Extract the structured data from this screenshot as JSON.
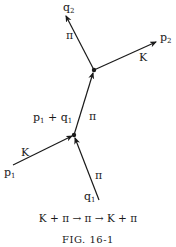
{
  "figure": {
    "caption": "FIG. 16-1",
    "equation": "K + π → π → K + π"
  },
  "vertices": [
    {
      "id": "lower",
      "x": 74,
      "y": 135
    },
    {
      "id": "upper",
      "x": 94,
      "y": 70
    }
  ],
  "lines": [
    {
      "id": "p1",
      "momentum": "p",
      "momentum_sub": "1",
      "particle": "K",
      "from": [
        13,
        165
      ],
      "to": [
        74,
        135
      ]
    },
    {
      "id": "q1",
      "momentum": "q",
      "momentum_sub": "1",
      "particle": "π",
      "from": [
        99,
        200
      ],
      "to": [
        74,
        135
      ]
    },
    {
      "id": "internal",
      "momentum": "p₁ + q₁",
      "particle": "π",
      "from": [
        74,
        135
      ],
      "to": [
        94,
        70
      ]
    },
    {
      "id": "q2",
      "momentum": "q",
      "momentum_sub": "2",
      "particle": "π",
      "from": [
        94,
        70
      ],
      "to": [
        65,
        14
      ]
    },
    {
      "id": "p2",
      "momentum": "p",
      "momentum_sub": "2",
      "particle": "K",
      "from": [
        94,
        70
      ],
      "to": [
        157,
        41
      ]
    }
  ],
  "labels": {
    "q2": {
      "main": "q",
      "sub": "2"
    },
    "p2": {
      "main": "p",
      "sub": "2"
    },
    "p1": {
      "main": "p",
      "sub": "1"
    },
    "q1": {
      "main": "q",
      "sub": "1"
    },
    "internal_a": {
      "main": "p",
      "sub": "1"
    },
    "internal_plus": "+",
    "internal_b": {
      "main": "q",
      "sub": "1"
    },
    "pi_q2": "π",
    "k_p2": "K",
    "pi_internal": "π",
    "k_p1": "K",
    "pi_q1": "π"
  },
  "colors": {
    "ink": "#1a1a1a",
    "background": "#ffffff"
  }
}
